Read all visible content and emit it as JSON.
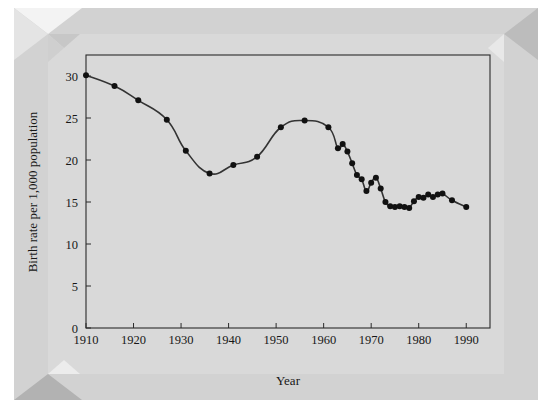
{
  "figure": {
    "background_color": "#ffffff",
    "frame_color": "#d2d2d2",
    "plot_background_color": "#d9d9d9"
  },
  "chart_data": {
    "type": "line",
    "title": "",
    "subtitle": "",
    "xlabel": "Year",
    "ylabel": "Birth rate per 1,000 population",
    "xlim": [
      1910,
      1995
    ],
    "ylim": [
      0,
      32.5
    ],
    "xticks": [
      1910,
      1920,
      1930,
      1940,
      1950,
      1960,
      1970,
      1980,
      1990
    ],
    "xtick_labels": [
      "1910",
      "1920",
      "1930",
      "1940",
      "1950",
      "1960",
      "1970",
      "1980",
      "1990"
    ],
    "yticks": [
      0,
      5,
      10,
      15,
      20,
      25,
      30
    ],
    "ytick_labels": [
      "0",
      "5",
      "10",
      "15",
      "20",
      "25",
      "30"
    ],
    "grid": false,
    "legend": false,
    "legend_position": "none",
    "marker": "filled-circle",
    "marker_color": "#111111",
    "line_color": "#333333",
    "line_width": 1.6,
    "x": [
      1910,
      1916,
      1921,
      1927,
      1931,
      1936,
      1941,
      1946,
      1951,
      1956,
      1961,
      1963,
      1964,
      1965,
      1966,
      1967,
      1968,
      1969,
      1970,
      1971,
      1972,
      1973,
      1974,
      1975,
      1976,
      1977,
      1978,
      1979,
      1980,
      1981,
      1982,
      1983,
      1984,
      1985,
      1987,
      1990
    ],
    "y": [
      30.1,
      28.8,
      27.1,
      24.8,
      21.1,
      18.4,
      19.4,
      20.4,
      23.9,
      24.7,
      23.9,
      21.4,
      21.9,
      21.0,
      19.6,
      18.2,
      17.7,
      16.3,
      17.3,
      17.9,
      16.6,
      15.0,
      14.5,
      14.4,
      14.5,
      14.4,
      14.3,
      15.1,
      15.6,
      15.5,
      15.9,
      15.6,
      15.9,
      16.0,
      15.2,
      14.4
    ],
    "points": [
      {
        "year": 1910,
        "rate": 30.1
      },
      {
        "year": 1916,
        "rate": 28.8
      },
      {
        "year": 1921,
        "rate": 27.1
      },
      {
        "year": 1927,
        "rate": 24.8
      },
      {
        "year": 1931,
        "rate": 21.1
      },
      {
        "year": 1936,
        "rate": 18.4
      },
      {
        "year": 1941,
        "rate": 19.4
      },
      {
        "year": 1946,
        "rate": 20.4
      },
      {
        "year": 1951,
        "rate": 23.9
      },
      {
        "year": 1956,
        "rate": 24.7
      },
      {
        "year": 1961,
        "rate": 23.9
      },
      {
        "year": 1963,
        "rate": 21.4
      },
      {
        "year": 1964,
        "rate": 21.9
      },
      {
        "year": 1965,
        "rate": 21.0
      },
      {
        "year": 1966,
        "rate": 19.6
      },
      {
        "year": 1967,
        "rate": 18.2
      },
      {
        "year": 1968,
        "rate": 17.7
      },
      {
        "year": 1969,
        "rate": 16.3
      },
      {
        "year": 1970,
        "rate": 17.3
      },
      {
        "year": 1971,
        "rate": 17.9
      },
      {
        "year": 1972,
        "rate": 16.6
      },
      {
        "year": 1973,
        "rate": 15.0
      },
      {
        "year": 1974,
        "rate": 14.5
      },
      {
        "year": 1975,
        "rate": 14.4
      },
      {
        "year": 1976,
        "rate": 14.5
      },
      {
        "year": 1977,
        "rate": 14.4
      },
      {
        "year": 1978,
        "rate": 14.3
      },
      {
        "year": 1979,
        "rate": 15.1
      },
      {
        "year": 1980,
        "rate": 15.6
      },
      {
        "year": 1981,
        "rate": 15.5
      },
      {
        "year": 1982,
        "rate": 15.9
      },
      {
        "year": 1983,
        "rate": 15.6
      },
      {
        "year": 1984,
        "rate": 15.9
      },
      {
        "year": 1985,
        "rate": 16.0
      },
      {
        "year": 1987,
        "rate": 15.2
      },
      {
        "year": 1990,
        "rate": 14.4
      }
    ]
  }
}
